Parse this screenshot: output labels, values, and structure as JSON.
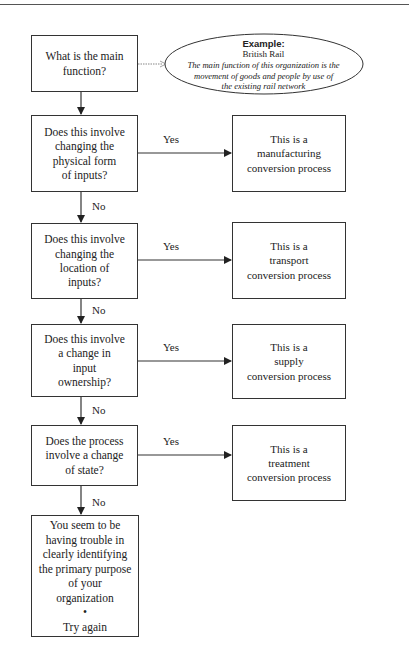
{
  "diagram": {
    "start": {
      "text": "What is the main\nfunction?"
    },
    "example": {
      "title": "Example:",
      "subtitle": "British Rail",
      "body": "The main function of this organization is the\nmovement of goods and people by use of\nthe existing rail network"
    },
    "questions": [
      {
        "text": "Does this involve\nchanging the\nphysical form\nof inputs?",
        "yes_label": "Yes",
        "no_label": "No",
        "result": "This is a\nmanufacturing\nconversion process"
      },
      {
        "text": "Does this involve\nchanging the\nlocation of\ninputs?",
        "yes_label": "Yes",
        "no_label": "No",
        "result": "This is a\ntransport\nconversion process"
      },
      {
        "text": "Does this involve\na change in\ninput\nownership?",
        "yes_label": "Yes",
        "no_label": "No",
        "result": "This is a\nsupply\nconversion process"
      },
      {
        "text": "Does the process\ninvolve a change\nof state?",
        "yes_label": "Yes",
        "no_label": "No",
        "result": "This is a\ntreatment\nconversion process"
      }
    ],
    "fallback": {
      "text": "You seem to be\nhaving trouble in\nclearly identifying\nthe primary purpose\nof your\norganization\n•\nTry again"
    }
  },
  "colors": {
    "line": "#333333",
    "background": "#ffffff"
  }
}
